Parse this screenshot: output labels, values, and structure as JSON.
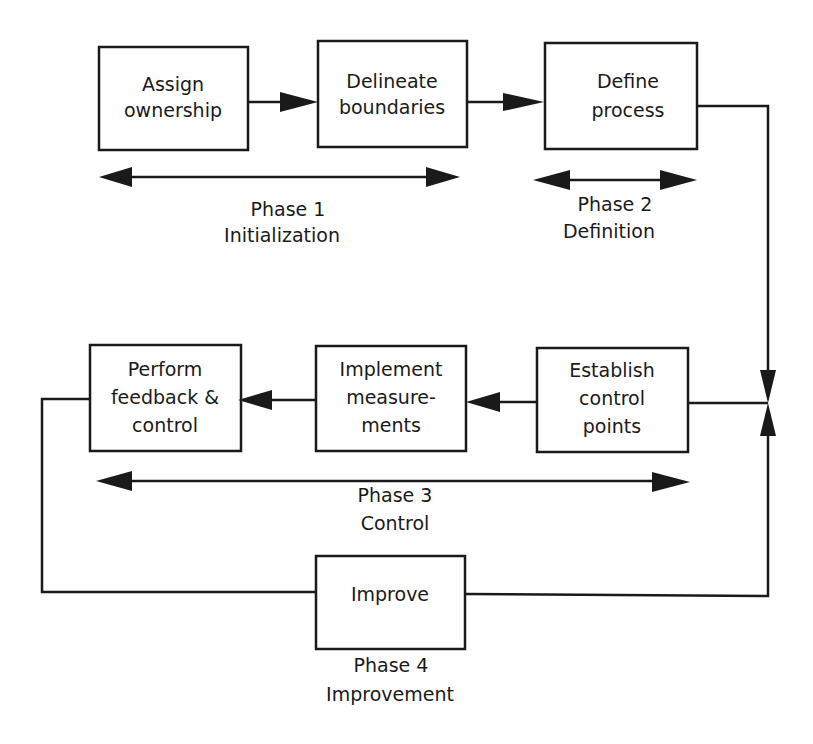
{
  "diagram": {
    "type": "process-flow",
    "colors": {
      "stroke": "#1a1a1a",
      "background": "#ffffff",
      "text": "#1a1a1a"
    },
    "boxes": [
      {
        "id": "assign",
        "lines": [
          "Assign",
          "ownership"
        ]
      },
      {
        "id": "delineate",
        "lines": [
          "Delineate",
          "boundaries"
        ]
      },
      {
        "id": "define",
        "lines": [
          "Define",
          "process"
        ]
      },
      {
        "id": "establish",
        "lines": [
          "Establish",
          "control",
          "points"
        ]
      },
      {
        "id": "implement",
        "lines": [
          "Implement",
          "measure-",
          "ments"
        ]
      },
      {
        "id": "perform",
        "lines": [
          "Perform",
          "feedback &",
          "control"
        ]
      },
      {
        "id": "improve",
        "lines": [
          "Improve"
        ]
      }
    ],
    "phases": [
      {
        "id": "phase1",
        "title": "Phase 1",
        "name": "Initialization"
      },
      {
        "id": "phase2",
        "title": "Phase 2",
        "name": "Definition"
      },
      {
        "id": "phase3",
        "title": "Phase 3",
        "name": "Control"
      },
      {
        "id": "phase4",
        "title": "Phase 4",
        "name": "Improvement"
      }
    ],
    "connections": [
      {
        "from": "assign",
        "to": "delineate"
      },
      {
        "from": "delineate",
        "to": "define"
      },
      {
        "from": "define",
        "to": "establish"
      },
      {
        "from": "establish",
        "to": "implement"
      },
      {
        "from": "implement",
        "to": "perform"
      },
      {
        "from": "perform",
        "to": "improve"
      },
      {
        "from": "improve",
        "to": "establish"
      }
    ]
  }
}
